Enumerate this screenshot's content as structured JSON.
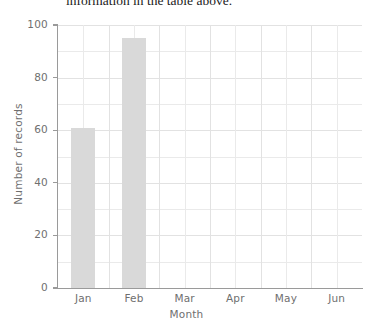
{
  "document": {
    "clipped_sentence": "information in the table above."
  },
  "chart_data": {
    "type": "bar",
    "title": "",
    "xlabel": "Month",
    "ylabel": "Number of records",
    "categories": [
      "Jan",
      "Feb",
      "Mar",
      "Apr",
      "May",
      "Jun"
    ],
    "values": [
      61,
      95,
      0,
      0,
      0,
      0
    ],
    "ylim": [
      0,
      100
    ],
    "ytick_labels": [
      "0",
      "20",
      "40",
      "60",
      "80",
      "100"
    ],
    "ytick_values": [
      0,
      20,
      40,
      60,
      80,
      100
    ],
    "minor_ytick_values": [
      10,
      30,
      50,
      70,
      90
    ],
    "grid": true,
    "legend": false,
    "bar_color": "#d9d9d9",
    "axis_color": "#9a9a9a",
    "grid_color": "#eaeaea",
    "text_color": "#6f6f6f"
  }
}
